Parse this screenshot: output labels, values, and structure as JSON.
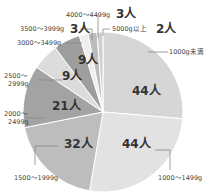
{
  "chart_data": {
    "type": "pie",
    "title": "",
    "unit": "人",
    "start_angle_deg": 0,
    "direction": "clockwise",
    "categories": [
      "1000g未満",
      "1000～1499g",
      "1500～1999g",
      "2000～2499g",
      "2500～2999g",
      "3000～3499g",
      "3500～3999g",
      "4000～4499g",
      "5000g以上"
    ],
    "values": [
      44,
      44,
      32,
      21,
      9,
      9,
      3,
      3,
      2
    ],
    "value_labels": [
      "44人",
      "44人",
      "32人",
      "21人",
      "9人",
      "9人",
      "3人",
      "3人",
      "2人"
    ],
    "colors": [
      "#d6d6d6",
      "#e2e2e2",
      "#bdbdbd",
      "#a3a3a3",
      "#dcdcdc",
      "#9e9e9e",
      "#eeeeee",
      "#bcbcbc",
      "#cfcfcf"
    ],
    "total": 167,
    "legend": "none (direct labels with leader lines)"
  }
}
